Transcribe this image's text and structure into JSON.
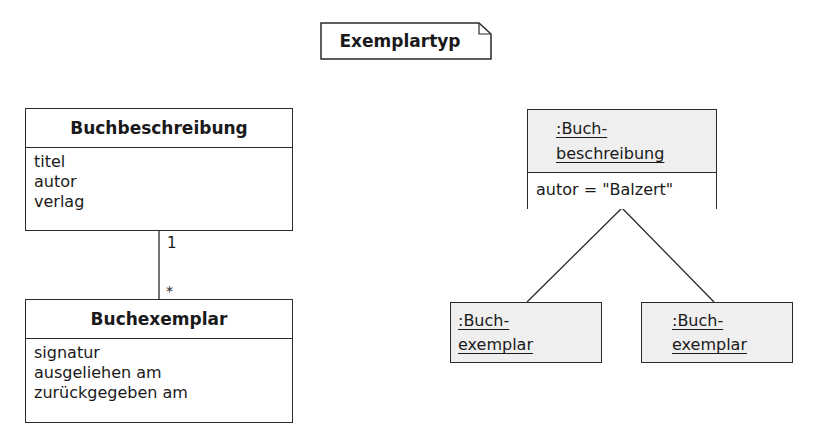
{
  "note": {
    "label": "Exemplartyp"
  },
  "class_diagram": {
    "classes": [
      {
        "name": "Buchbeschreibung",
        "attributes": [
          "titel",
          "autor",
          "verlag"
        ]
      },
      {
        "name": "Buchexemplar",
        "attributes": [
          "signatur",
          "ausgeliehen am",
          "zurückgegeben am"
        ]
      }
    ],
    "association": {
      "multiplicity_top": "1",
      "multiplicity_bottom": "*"
    }
  },
  "object_diagram": {
    "parent": {
      "name_line1": ":Buch-",
      "name_line2": "beschreibung",
      "attribute": "autor = \"Balzert\""
    },
    "children": [
      {
        "name_line1": ":Buch-",
        "name_line2": "exemplar"
      },
      {
        "name_line1": ":Buch-",
        "name_line2": "exemplar"
      }
    ]
  },
  "colors": {
    "line": "#2a2a2a",
    "object_fill": "#efefef",
    "background": "#ffffff"
  }
}
